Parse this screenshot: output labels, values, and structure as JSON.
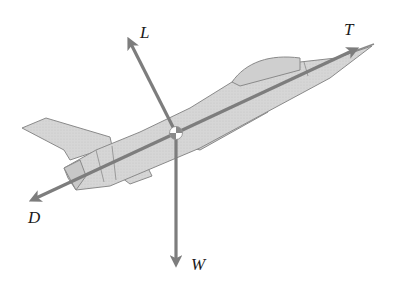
{
  "diagram": {
    "colors": {
      "background": "#ffffff",
      "aircraft_fill": "#d4d4d4",
      "aircraft_outline": "#8a8a8a",
      "vector": "#7d7d7d",
      "label": "#1a1a1a"
    },
    "center_of_gravity": {
      "x": 176,
      "y": 133,
      "symbol": "cg-marker"
    },
    "forces": [
      {
        "id": "lift",
        "label": "L",
        "from": [
          176,
          133
        ],
        "to": [
          127,
          36
        ],
        "label_pos": [
          140,
          38
        ]
      },
      {
        "id": "thrust",
        "label": "T",
        "from": [
          176,
          133
        ],
        "to": [
          360,
          47
        ],
        "label_pos": [
          344,
          35
        ]
      },
      {
        "id": "drag",
        "label": "D",
        "from": [
          176,
          133
        ],
        "to": [
          28,
          202
        ],
        "label_pos": [
          28,
          223
        ]
      },
      {
        "id": "weight",
        "label": "W",
        "from": [
          176,
          133
        ],
        "to": [
          176,
          268
        ],
        "label_pos": [
          191,
          270
        ]
      }
    ]
  }
}
